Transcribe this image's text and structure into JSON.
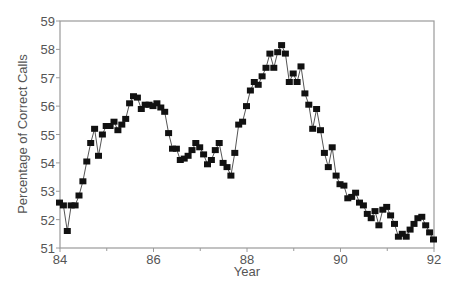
{
  "chart_data": {
    "type": "line",
    "title": "",
    "xlabel": "Year",
    "ylabel": "Percentage of Correct Calls",
    "xlim": [
      84,
      92
    ],
    "ylim": [
      51,
      59
    ],
    "xticks": [
      84,
      86,
      88,
      90,
      92
    ],
    "xminor_ticks": [
      85,
      87,
      89,
      91
    ],
    "yticks": [
      51,
      52,
      53,
      54,
      55,
      56,
      57,
      58,
      59
    ],
    "grid": false,
    "legend": null,
    "marker": "square",
    "x_start": 84.0,
    "x_step": 0.08333,
    "values": [
      52.6,
      52.5,
      51.6,
      52.5,
      52.5,
      52.85,
      53.35,
      54.05,
      54.7,
      55.2,
      54.25,
      55.0,
      55.3,
      55.3,
      55.45,
      55.15,
      55.35,
      55.55,
      56.1,
      56.35,
      56.3,
      55.9,
      56.05,
      56.05,
      56.0,
      56.1,
      55.95,
      55.8,
      55.05,
      54.5,
      54.5,
      54.1,
      54.15,
      54.25,
      54.45,
      54.7,
      54.55,
      54.3,
      53.95,
      54.1,
      54.45,
      54.7,
      54.0,
      53.85,
      53.55,
      54.35,
      55.35,
      55.45,
      56.0,
      56.55,
      56.85,
      56.75,
      57.05,
      57.35,
      57.85,
      57.35,
      57.9,
      58.15,
      57.85,
      56.85,
      57.15,
      56.85,
      57.4,
      56.45,
      56.05,
      55.2,
      55.9,
      55.15,
      54.35,
      53.85,
      54.55,
      53.55,
      53.25,
      53.2,
      52.75,
      52.8,
      52.95,
      52.6,
      52.5,
      52.2,
      52.05,
      52.3,
      51.8,
      52.35,
      52.45,
      52.15,
      51.85,
      51.4,
      51.5,
      51.4,
      51.65,
      51.85,
      52.05,
      52.1,
      51.8,
      51.55,
      51.3
    ]
  },
  "colors": {
    "axis": "#9a9a9a",
    "line": "#555555",
    "marker": "#111111",
    "text": "#555555"
  }
}
